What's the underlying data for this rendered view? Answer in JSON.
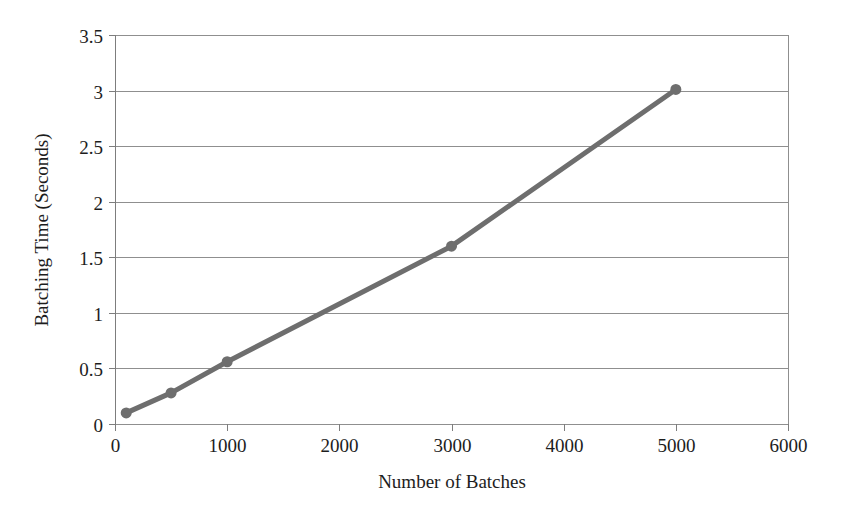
{
  "chart_data": {
    "type": "line",
    "title": "",
    "subtitle": "",
    "xlabel": "Number of Batches",
    "ylabel": "Batching Time (Seconds)",
    "xlim": [
      0,
      6000
    ],
    "ylim": [
      0,
      3.5
    ],
    "xticks": [
      0,
      1000,
      2000,
      3000,
      4000,
      5000,
      6000
    ],
    "xtick_labels": [
      "0",
      "1000",
      "2000",
      "3000",
      "4000",
      "5000",
      "6000"
    ],
    "yticks": [
      0,
      0.5,
      1,
      1.5,
      2,
      2.5,
      3,
      3.5
    ],
    "ytick_labels": [
      "0",
      "0.5",
      "1",
      "1.5",
      "2",
      "2.5",
      "3",
      "3.5"
    ],
    "grid": {
      "horizontal": true,
      "vertical": false
    },
    "legend": {
      "visible": false,
      "position": "none",
      "entries": []
    },
    "annotations": [],
    "series": [
      {
        "name": "Batching Time",
        "marker": "circle",
        "marker_size": 11,
        "line_width": 5,
        "color": "#6e6e6e",
        "x": [
          100,
          500,
          1000,
          3000,
          5000
        ],
        "y": [
          0.1,
          0.28,
          0.56,
          1.6,
          3.01
        ],
        "points": [
          {
            "x": 100,
            "y": 0.1
          },
          {
            "x": 500,
            "y": 0.28
          },
          {
            "x": 1000,
            "y": 0.56
          },
          {
            "x": 3000,
            "y": 1.6
          },
          {
            "x": 5000,
            "y": 3.01
          }
        ]
      }
    ]
  },
  "colors": {
    "series": "#6e6e6e",
    "gridline": "#8f8f8f",
    "axis": "#7d7d7d",
    "text": "#1d1d1d",
    "background": "#ffffff"
  },
  "plot_geometry": {
    "left": 115,
    "right": 788,
    "top": 35,
    "bottom": 424
  }
}
